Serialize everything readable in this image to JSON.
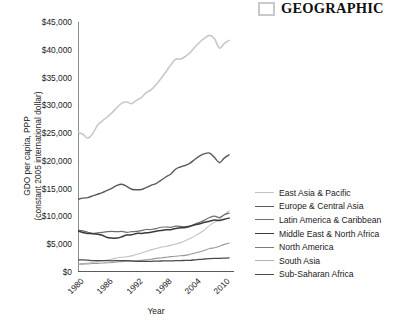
{
  "brand": {
    "mark_icon": "square-outline-icon",
    "word": "GEOGRAPHIC",
    "mark_color": "#c9c9c9"
  },
  "chart_data": {
    "type": "line",
    "title": "",
    "xlabel": "Year",
    "ylabel_line1": "GDO per capita, PPP",
    "ylabel_line2": "(constant 2005 international dollar)",
    "ylim": [
      0,
      45000
    ],
    "xlim": [
      1980,
      2012
    ],
    "grid": false,
    "legend_position": "right",
    "ytick_labels": [
      "$0",
      "$5,000",
      "$10,000",
      "$15,000",
      "$20,000",
      "$25,000",
      "$30,000",
      "$35,000",
      "$40,000",
      "$45,000"
    ],
    "ytick_values": [
      0,
      5000,
      10000,
      15000,
      20000,
      25000,
      30000,
      35000,
      40000,
      45000
    ],
    "xtick_labels": [
      "1980",
      "1986",
      "1992",
      "1998",
      "2004",
      "2010"
    ],
    "xtick_values": [
      1980,
      1986,
      1992,
      1998,
      2004,
      2010
    ],
    "x": [
      1980,
      1981,
      1982,
      1983,
      1984,
      1985,
      1986,
      1987,
      1988,
      1989,
      1990,
      1991,
      1992,
      1993,
      1994,
      1995,
      1996,
      1997,
      1998,
      1999,
      2000,
      2001,
      2002,
      2003,
      2004,
      2005,
      2006,
      2007,
      2008,
      2009,
      2010,
      2011
    ],
    "series": [
      {
        "name": "East Asia & Pacific",
        "color": "#c2c2c2",
        "width": 1.1,
        "values": [
          1450,
          1520,
          1600,
          1710,
          1870,
          2010,
          2140,
          2320,
          2520,
          2660,
          2740,
          2900,
          3140,
          3420,
          3700,
          3980,
          4240,
          4460,
          4600,
          4790,
          5040,
          5290,
          5620,
          6040,
          6500,
          7020,
          7640,
          8400,
          8940,
          9500,
          10300,
          11000
        ]
      },
      {
        "name": "Europe & Central Asia",
        "color": "#5a5a5a",
        "width": 1.4,
        "values": [
          13100,
          13300,
          13400,
          13700,
          14000,
          14300,
          14700,
          15100,
          15600,
          15800,
          15400,
          14900,
          14800,
          14850,
          15200,
          15600,
          15900,
          16500,
          17100,
          17600,
          18500,
          18900,
          19200,
          19600,
          20300,
          20900,
          21300,
          21400,
          20600,
          19700,
          20500,
          21100
        ]
      },
      {
        "name": "Latin America & Caribbean",
        "color": "#6e6e6e",
        "width": 1.2,
        "values": [
          7500,
          7400,
          7150,
          6950,
          7050,
          7150,
          7250,
          7300,
          7250,
          7300,
          7150,
          7250,
          7300,
          7450,
          7650,
          7650,
          7800,
          8050,
          8100,
          8050,
          8250,
          8200,
          8150,
          8250,
          8650,
          8950,
          9350,
          9800,
          10050,
          9800,
          10300,
          10600
        ]
      },
      {
        "name": "Middle East & North Africa",
        "color": "#3a3a3a",
        "width": 1.5,
        "values": [
          7400,
          7100,
          6950,
          6900,
          6800,
          6600,
          6200,
          6100,
          6100,
          6350,
          6650,
          6700,
          6950,
          6950,
          7050,
          7150,
          7350,
          7450,
          7600,
          7600,
          7850,
          7950,
          8000,
          8250,
          8500,
          8700,
          8950,
          9150,
          9350,
          9250,
          9500,
          9700
        ]
      },
      {
        "name": "North America",
        "color": "#c8c8c8",
        "width": 1.6,
        "values": [
          25200,
          24800,
          24100,
          24900,
          26400,
          27200,
          27900,
          28700,
          29600,
          30400,
          30600,
          30300,
          30900,
          31400,
          32300,
          32800,
          33700,
          34800,
          36000,
          37200,
          38300,
          38300,
          38800,
          39500,
          40500,
          41400,
          42100,
          42600,
          42000,
          40300,
          41100,
          41700
        ]
      },
      {
        "name": "South Asia",
        "color": "#9a9a9a",
        "width": 1.1,
        "values": [
          1400,
          1420,
          1450,
          1520,
          1560,
          1610,
          1660,
          1700,
          1810,
          1870,
          1940,
          1950,
          2020,
          2090,
          2190,
          2310,
          2450,
          2520,
          2630,
          2760,
          2830,
          2930,
          2990,
          3190,
          3410,
          3650,
          3920,
          4230,
          4350,
          4650,
          4970,
          5220
        ]
      },
      {
        "name": "Sub-Saharan Africa",
        "color": "#4a4a4a",
        "width": 1.3,
        "values": [
          2200,
          2180,
          2120,
          2050,
          2030,
          2060,
          2040,
          2020,
          2040,
          2050,
          2030,
          1990,
          1930,
          1900,
          1900,
          1920,
          1960,
          1980,
          1990,
          2010,
          2030,
          2060,
          2080,
          2110,
          2190,
          2260,
          2340,
          2420,
          2470,
          2450,
          2510,
          2560
        ]
      }
    ]
  },
  "legend": {
    "items": [
      {
        "label": "East Asia & Pacific",
        "color": "#c2c2c2",
        "width": 1.1
      },
      {
        "label": "Europe & Central Asia",
        "color": "#5a5a5a",
        "width": 1.6
      },
      {
        "label": "Latin America & Caribbean",
        "color": "#6e6e6e",
        "width": 1.4
      },
      {
        "label": "Middle East & North Africa",
        "color": "#3a3a3a",
        "width": 1.8
      },
      {
        "label": "North America",
        "color": "#7a7a7a",
        "width": 1.3
      },
      {
        "label": "South Asia",
        "color": "#b0b0b0",
        "width": 1.2
      },
      {
        "label": "Sub-Saharan Africa",
        "color": "#4a4a4a",
        "width": 1.5
      }
    ]
  }
}
